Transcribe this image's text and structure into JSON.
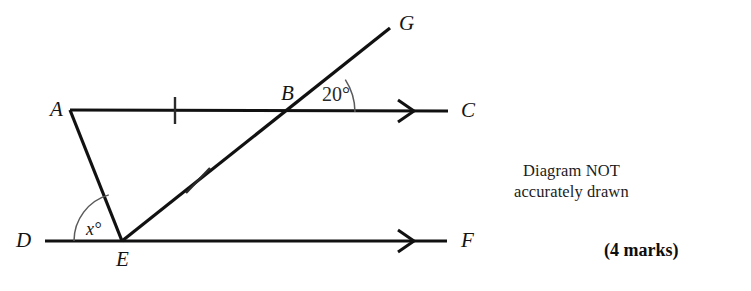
{
  "figure": {
    "type": "geometry-diagram",
    "points": [
      {
        "id": "A",
        "label": "A",
        "x": 70,
        "y": 110
      },
      {
        "id": "B",
        "label": "B",
        "x": 295,
        "y": 112
      },
      {
        "id": "C",
        "label": "C",
        "x": 448,
        "y": 111
      },
      {
        "id": "D",
        "label": "D",
        "x": 45,
        "y": 241
      },
      {
        "id": "E",
        "label": "E",
        "x": 122,
        "y": 241
      },
      {
        "id": "F",
        "label": "F",
        "x": 447,
        "y": 241
      },
      {
        "id": "G",
        "label": "G",
        "x": 390,
        "y": 28
      }
    ],
    "point_labels": [
      {
        "name": "label-A",
        "text": "A",
        "x": 50,
        "y": 116
      },
      {
        "name": "label-B",
        "text": "B",
        "x": 281,
        "y": 100
      },
      {
        "name": "label-C",
        "text": "C",
        "x": 461,
        "y": 117
      },
      {
        "name": "label-D",
        "text": "D",
        "x": 16,
        "y": 247
      },
      {
        "name": "label-E",
        "text": "E",
        "x": 116,
        "y": 266
      },
      {
        "name": "label-F",
        "text": "F",
        "x": 461,
        "y": 247
      },
      {
        "name": "label-G",
        "text": "G",
        "x": 399,
        "y": 30
      }
    ],
    "segments": [
      {
        "name": "line-A-C",
        "from": "A",
        "to": "C",
        "width": 3.2
      },
      {
        "name": "line-D-F",
        "from": "D",
        "to": "F",
        "width": 3.2
      },
      {
        "name": "line-A-E",
        "from": "A",
        "to": "E",
        "width": 3.2
      },
      {
        "name": "line-E-G",
        "from": "E",
        "to": "G",
        "width": 3.2
      }
    ],
    "arrow_markers": [
      {
        "name": "arrow-marker-line-ac",
        "x": 410,
        "y": 111
      },
      {
        "name": "arrow-marker-line-df",
        "x": 410,
        "y": 241
      }
    ],
    "tick_marks": [
      {
        "name": "tick-segment-ab",
        "x": 175,
        "y": 110,
        "angle_deg": 90
      },
      {
        "name": "tick-segment-eb",
        "x": 198,
        "y": 180,
        "angle_deg": 27
      }
    ],
    "angles": [
      {
        "name": "angle-20-at-b",
        "value": "20°",
        "vertex": "B",
        "label_x": 322,
        "label_y": 101,
        "arc_radius": 60,
        "from_deg": 0,
        "to_deg": 32
      },
      {
        "name": "angle-x-at-e",
        "value": "x°",
        "vertex": "E",
        "label_x": 86,
        "label_y": 235,
        "arc_radius": 48,
        "from_deg": 180,
        "to_deg": 106
      }
    ]
  },
  "annotations": {
    "not_accurate_line1": "Diagram NOT",
    "not_accurate_line2": "accurately drawn",
    "marks": "(4 marks)"
  },
  "colors": {
    "ink": "#1a1a1a",
    "line": "#111111",
    "arc": "#4a4a4a",
    "background": "#ffffff"
  }
}
